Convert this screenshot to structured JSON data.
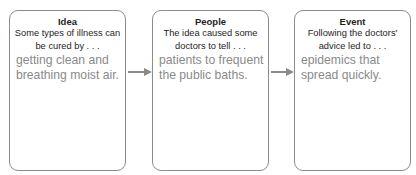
{
  "header": {
    "instruction_text_visible": false
  },
  "diagram": {
    "boxes": [
      {
        "title": "Idea",
        "prompt": "Some types of illness can be cured by . . .",
        "answer": "getting clean and breathing moist air."
      },
      {
        "title": "People",
        "prompt": "The idea caused some doctors to tell . . .",
        "answer": "patients to frequent the public baths."
      },
      {
        "title": "Event",
        "prompt": "Following the doctors' advice led to . . .",
        "answer": "epidemics that spread quickly."
      }
    ],
    "arrows": [
      {
        "from": "Idea",
        "to": "People",
        "icon": "right-arrow-icon"
      },
      {
        "from": "People",
        "to": "Event",
        "icon": "right-arrow-icon"
      }
    ]
  },
  "colors": {
    "border": "#8c8c8c",
    "title_text": "#1e1e1e",
    "answer_text": "#8a8a8a",
    "arrow": "#8a8a8a"
  }
}
